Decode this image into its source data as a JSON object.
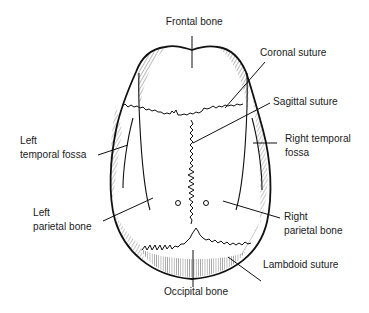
{
  "diagram": {
    "labels": {
      "frontal_bone": "Frontal bone",
      "coronal_suture": "Coronal suture",
      "sagittal_suture": "Sagittal suture",
      "left_temporal_fossa_1": "Left",
      "left_temporal_fossa_2": "temporal fossa",
      "right_temporal_fossa_1": "Right temporal",
      "right_temporal_fossa_2": "fossa",
      "left_parietal_bone_1": "Left",
      "left_parietal_bone_2": "parietal bone",
      "right_parietal_bone_1": "Right",
      "right_parietal_bone_2": "parietal bone",
      "lambdoid_suture": "Lambdoid suture",
      "occipital_bone": "Occipital bone"
    },
    "colors": {
      "ink": "#1a1a1a",
      "background": "#ffffff"
    }
  }
}
